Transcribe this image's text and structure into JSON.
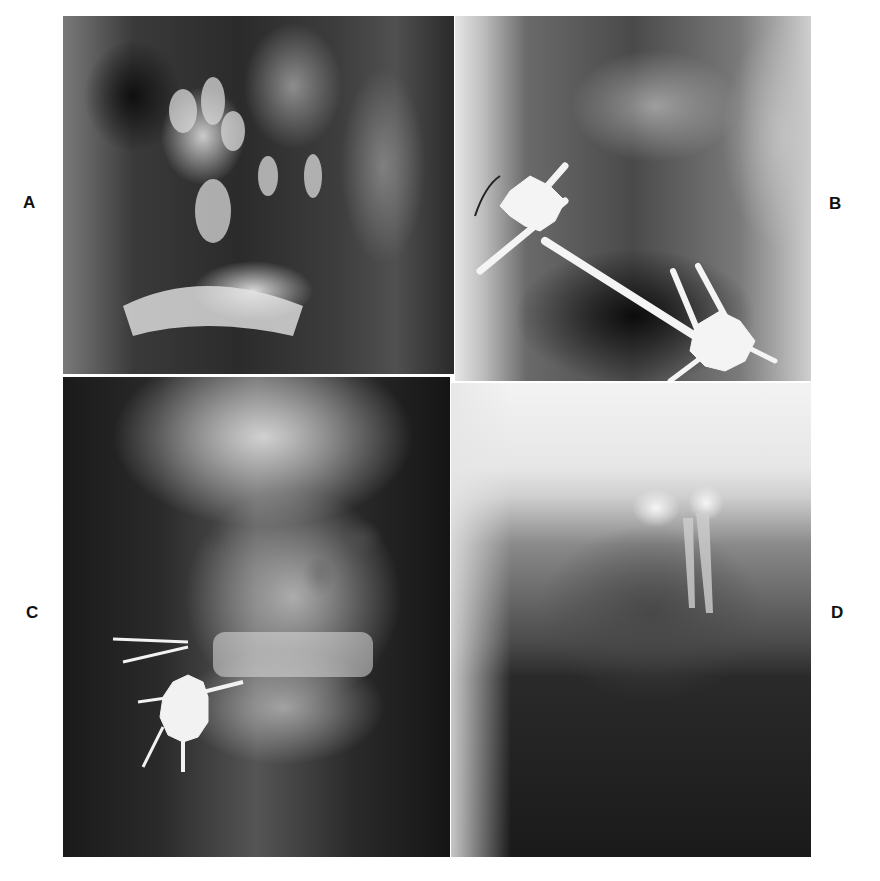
{
  "figure": {
    "panels": [
      {
        "id": "A",
        "label": "A",
        "description": "Lateral radiograph of mandible and maxilla showing teeth and fracture region"
      },
      {
        "id": "B",
        "label": "B",
        "description": "Lateral radiograph with external pin fixation apparatus across mandible"
      },
      {
        "id": "C",
        "label": "C",
        "description": "Posteroanterior skull radiograph with external fixation clamp at mandibular angle"
      },
      {
        "id": "D",
        "label": "D",
        "description": "Close radiograph of anterior mandible showing teeth roots"
      }
    ]
  },
  "colors": {
    "background": "#ffffff",
    "label": "#111111",
    "hardware": "#f4f4f4"
  }
}
